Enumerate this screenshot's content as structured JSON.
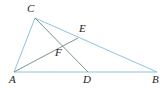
{
  "figure": {
    "canvas": {
      "width": 166,
      "height": 88,
      "background": "#ffffff"
    },
    "colors": {
      "triangle_stroke": "#8fc4dd",
      "cevian_stroke": "#7f9488",
      "label_color": "#1c1c1c"
    },
    "points": [
      {
        "id": "A",
        "label": "A",
        "x": 14,
        "y": 72,
        "label_x": 9,
        "label_y": 74
      },
      {
        "id": "B",
        "label": "B",
        "x": 157,
        "y": 72,
        "label_x": 152,
        "label_y": 74
      },
      {
        "id": "C",
        "label": "C",
        "x": 35,
        "y": 18,
        "label_x": 27,
        "label_y": 3
      },
      {
        "id": "D",
        "label": "D",
        "x": 88,
        "y": 72,
        "label_x": 83,
        "label_y": 74
      },
      {
        "id": "E",
        "label": "E",
        "x": 78,
        "y": 38,
        "label_x": 79,
        "label_y": 23
      },
      {
        "id": "F",
        "label": "F",
        "x": 58,
        "y": 45,
        "label_x": 55,
        "label_y": 47
      }
    ],
    "segments": [
      {
        "id": "AB",
        "from": "A",
        "to": "B",
        "style": "triangle-side"
      },
      {
        "id": "AC",
        "from": "A",
        "to": "C",
        "style": "triangle-side"
      },
      {
        "id": "CB",
        "from": "C",
        "to": "B",
        "style": "triangle-side"
      },
      {
        "id": "AE",
        "from": "A",
        "to": "E",
        "style": "cevian"
      },
      {
        "id": "CD",
        "from": "C",
        "to": "D",
        "style": "cevian"
      }
    ]
  }
}
